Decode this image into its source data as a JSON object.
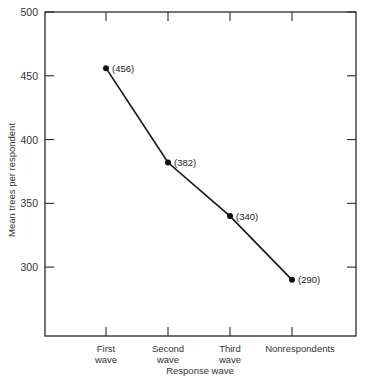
{
  "chart_data": {
    "type": "line",
    "title": "",
    "xlabel": "Response wave",
    "ylabel": "Mean trees per respondent",
    "categories": [
      [
        "First",
        "wave"
      ],
      [
        "Second",
        "wave"
      ],
      [
        "Third",
        "wave"
      ],
      [
        "Nonrespondents"
      ]
    ],
    "series": [
      {
        "name": "Mean trees per respondent",
        "values": [
          456,
          382,
          340,
          290
        ]
      }
    ],
    "point_labels": [
      "(456)",
      "(382)",
      "(340)",
      "(290)"
    ],
    "yticks": [
      300,
      350,
      400,
      450,
      500
    ],
    "ylim": [
      246,
      500
    ],
    "grid": false,
    "legend": null,
    "frame": "box with inward ticks on all sides"
  }
}
